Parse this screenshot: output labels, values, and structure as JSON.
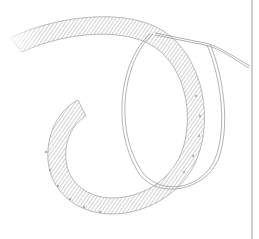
{
  "image": {
    "subject": "line-art coiled feather spiral with wire loop",
    "width": 259,
    "height": 239,
    "colors": {
      "background": "#ffffff",
      "stroke": "#9a9a9a",
      "stroke_light": "#c8c8c8",
      "edge_line": "#cfcfcf"
    }
  }
}
